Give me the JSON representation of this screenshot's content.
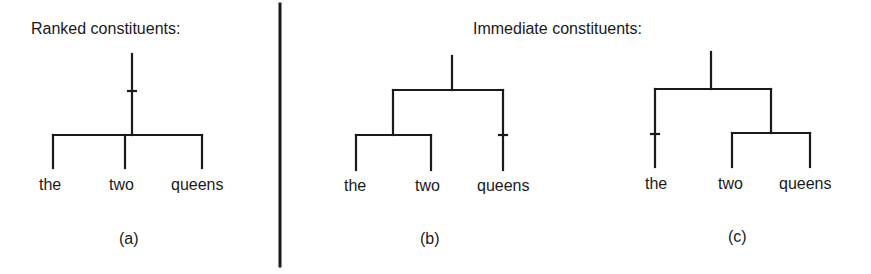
{
  "panels": {
    "left": {
      "title": "Ranked constituents:",
      "caption": "(a)",
      "words": [
        "the",
        "two",
        "queens"
      ]
    },
    "right": {
      "title": "Immediate constituents:",
      "tree_b": {
        "caption": "(b)",
        "words": [
          "the",
          "two",
          "queens"
        ]
      },
      "tree_c": {
        "caption": "(c)",
        "words": [
          "the",
          "two",
          "queens"
        ]
      }
    }
  },
  "structure": {
    "a": "[the two queens] (flat, ternary)",
    "b": "[[the two] queens]",
    "c": "[the [two queens]]"
  }
}
